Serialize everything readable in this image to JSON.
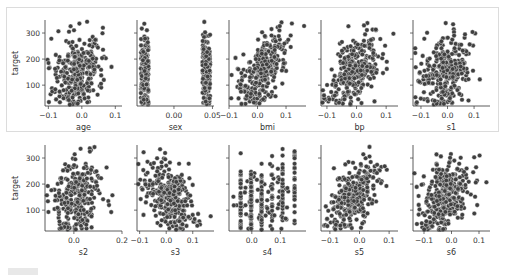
{
  "figure": {
    "ylabel": "target",
    "marker_color": "#3f3f3f",
    "marker_edge": "#ffffff",
    "frame_color": "#dcdcdc"
  },
  "chart_data": [
    {
      "type": "scatter",
      "title": "",
      "xlabel": "age",
      "ylabel": "target",
      "xticks": [
        "-0.1",
        "0.0",
        "0.1"
      ],
      "yticks": [
        "100",
        "200",
        "300"
      ],
      "xlim": [
        -0.11,
        0.12
      ],
      "ylim": [
        20,
        350
      ]
    },
    {
      "type": "scatter",
      "title": "",
      "xlabel": "sex",
      "ylabel": "target",
      "xticks": [
        "0.00",
        "0.05"
      ],
      "yticks": [
        "100",
        "200",
        "300"
      ],
      "xlim": [
        -0.048,
        0.052
      ],
      "ylim": [
        20,
        350
      ]
    },
    {
      "type": "scatter",
      "title": "",
      "xlabel": "bmi",
      "ylabel": "target",
      "xticks": [
        "-0.1",
        "0.0",
        "0.1"
      ],
      "yticks": [
        "100",
        "200",
        "300"
      ],
      "xlim": [
        -0.1,
        0.17
      ],
      "ylim": [
        20,
        350
      ]
    },
    {
      "type": "scatter",
      "title": "",
      "xlabel": "bp",
      "ylabel": "target",
      "xticks": [
        "-0.1",
        "0.0",
        "0.1"
      ],
      "yticks": [
        "100",
        "200",
        "300"
      ],
      "xlim": [
        -0.12,
        0.14
      ],
      "ylim": [
        20,
        350
      ]
    },
    {
      "type": "scatter",
      "title": "",
      "xlabel": "s1",
      "ylabel": "target",
      "xticks": [
        "-0.1",
        "0.0",
        "0.1"
      ],
      "yticks": [
        "100",
        "200",
        "300"
      ],
      "xlim": [
        -0.13,
        0.16
      ],
      "ylim": [
        20,
        350
      ]
    },
    {
      "type": "scatter",
      "title": "",
      "xlabel": "s2",
      "ylabel": "target",
      "xticks": [
        "0.0",
        "0.2"
      ],
      "yticks": [
        "100",
        "200",
        "300"
      ],
      "xlim": [
        -0.12,
        0.2
      ],
      "ylim": [
        20,
        350
      ]
    },
    {
      "type": "scatter",
      "title": "",
      "xlabel": "s3",
      "ylabel": "target",
      "xticks": [
        "-0.1",
        "0.0",
        "0.1"
      ],
      "yticks": [
        "100",
        "200",
        "300"
      ],
      "xlim": [
        -0.11,
        0.18
      ],
      "ylim": [
        20,
        350
      ]
    },
    {
      "type": "scatter",
      "title": "",
      "xlabel": "s4",
      "ylabel": "target",
      "xticks": [
        "0.0",
        "0.1"
      ],
      "yticks": [
        "100",
        "200",
        "300"
      ],
      "xlim": [
        -0.08,
        0.19
      ],
      "ylim": [
        20,
        350
      ]
    },
    {
      "type": "scatter",
      "title": "",
      "xlabel": "s5",
      "ylabel": "target",
      "xticks": [
        "-0.1",
        "0.0",
        "0.1"
      ],
      "yticks": [
        "100",
        "200",
        "300"
      ],
      "xlim": [
        -0.13,
        0.13
      ],
      "ylim": [
        20,
        350
      ]
    },
    {
      "type": "scatter",
      "title": "",
      "xlabel": "s6",
      "ylabel": "target",
      "xticks": [
        "-0.1",
        "0.0",
        "0.1"
      ],
      "yticks": [
        "100",
        "200",
        "300"
      ],
      "xlim": [
        -0.14,
        0.14
      ],
      "ylim": [
        20,
        350
      ]
    }
  ]
}
